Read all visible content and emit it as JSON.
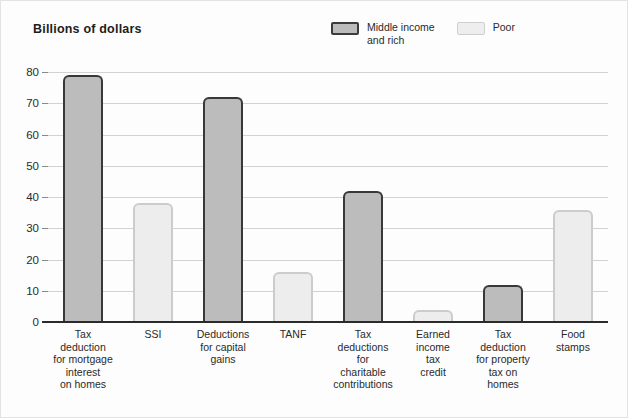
{
  "chart_data": {
    "type": "bar",
    "title": "Billions of dollars",
    "xlabel": "",
    "ylabel": "Billions of dollars",
    "ylim": [
      0,
      80
    ],
    "ytick_step": 10,
    "yticks": [
      80,
      70,
      60,
      50,
      40,
      30,
      20,
      10,
      0
    ],
    "grid": true,
    "legend_position": "top-right",
    "categories": [
      "Tax\ndeduction\nfor mortgage\ninterest\non homes",
      "SSI",
      "Deductions\nfor capital\ngains",
      "TANF",
      "Tax\ndeductions\nfor\ncharitable\ncontributions",
      "Earned\nincome\ntax\ncredit",
      "Tax\ndeduction\nfor property\ntax on\nhomes",
      "Food\nstamps"
    ],
    "series": [
      {
        "name": "Middle income and rich",
        "color": "#bcbcbc",
        "border_color": "#383838",
        "values": [
          79,
          null,
          72,
          null,
          42,
          null,
          12,
          null
        ]
      },
      {
        "name": "Poor",
        "color": "#ededed",
        "border_color": "#cccccc",
        "values": [
          null,
          38,
          null,
          16,
          null,
          4,
          null,
          36
        ]
      }
    ],
    "bars": [
      {
        "category": "Tax deduction for mortgage interest on homes",
        "value": 79,
        "group": "Middle income and rich"
      },
      {
        "category": "SSI",
        "value": 38,
        "group": "Poor"
      },
      {
        "category": "Deductions for capital gains",
        "value": 72,
        "group": "Middle income and rich"
      },
      {
        "category": "TANF",
        "value": 16,
        "group": "Poor"
      },
      {
        "category": "Tax deductions for charitable contributions",
        "value": 42,
        "group": "Middle income and rich"
      },
      {
        "category": "Earned income tax credit",
        "value": 4,
        "group": "Poor"
      },
      {
        "category": "Tax deduction for property tax on homes",
        "value": 12,
        "group": "Middle income and rich"
      },
      {
        "category": "Food stamps",
        "value": 36,
        "group": "Poor"
      }
    ]
  },
  "legend": {
    "entries": [
      {
        "label": "Middle income\nand rich",
        "style": "dark"
      },
      {
        "label": "Poor",
        "style": "light"
      }
    ]
  },
  "colors": {
    "dark_fill": "#bcbcbc",
    "dark_border": "#383838",
    "light_fill": "#ededed",
    "light_border": "#cccccc",
    "gridline": "#d2d2d2",
    "axis": "#2b2b2b",
    "text": "#2a2a2a",
    "background": "#fdfdfd"
  }
}
